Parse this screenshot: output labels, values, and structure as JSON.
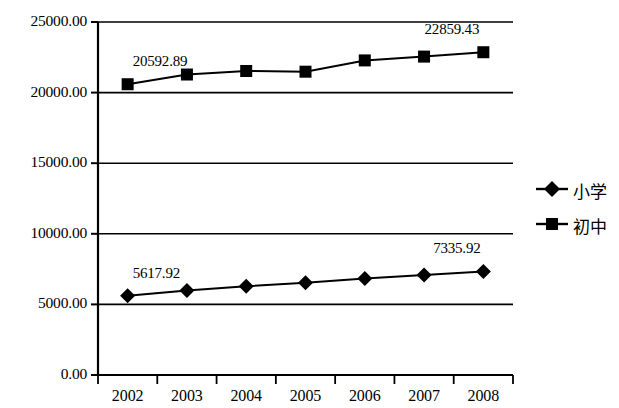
{
  "chart_data": {
    "type": "line",
    "title": "",
    "xlabel": "",
    "ylabel": "",
    "categories": [
      "2002",
      "2003",
      "2004",
      "2005",
      "2006",
      "2007",
      "2008"
    ],
    "ylim": [
      0,
      25000
    ],
    "ytick_labels": [
      "0.00",
      "5000.00",
      "10000.00",
      "15000.00",
      "20000.00",
      "25000.00"
    ],
    "ytick_values": [
      0,
      5000,
      10000,
      15000,
      20000,
      25000
    ],
    "grid": "horizontal",
    "legend_position": "right",
    "series": [
      {
        "name": "小学",
        "marker": "diamond",
        "values": [
          5617.92,
          5980.0,
          6280.0,
          6530.0,
          6830.0,
          7090.0,
          7335.92
        ],
        "labels": [
          {
            "category": "2002",
            "text": "5617.92"
          },
          {
            "category": "2008",
            "text": "7335.92"
          }
        ]
      },
      {
        "name": "初中",
        "marker": "square",
        "values": [
          20592.89,
          21280.0,
          21530.0,
          21480.0,
          22280.0,
          22550.0,
          22859.43
        ],
        "labels": [
          {
            "category": "2002",
            "text": "20592.89"
          },
          {
            "category": "2008",
            "text": "22859.43"
          }
        ]
      }
    ],
    "colors": {
      "series_line": "#000000",
      "axis": "#000000",
      "grid": "#000000",
      "background": "#ffffff"
    }
  },
  "legend": {
    "items": [
      {
        "label": "小学",
        "marker": "diamond"
      },
      {
        "label": "初中",
        "marker": "square"
      }
    ]
  }
}
